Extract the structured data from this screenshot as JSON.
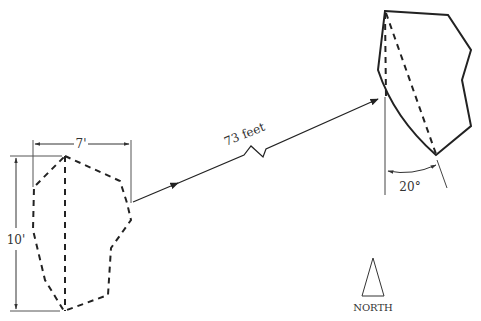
{
  "diagram": {
    "title": "",
    "labels": {
      "width_dimension": "7'",
      "height_dimension": "10'",
      "distance": "73 feet",
      "angle": "20°",
      "north": "NORTH"
    },
    "colors": {
      "stroke": "#222222",
      "thin_stroke": "#444444",
      "text": "#333333",
      "background": "#ffffff"
    },
    "shapes": {
      "original_outline": {
        "style": "dashed",
        "points": [
          [
            65,
            156
          ],
          [
            120,
            181
          ],
          [
            127,
            203
          ],
          [
            131,
            220
          ],
          [
            111,
            248
          ],
          [
            108,
            295
          ],
          [
            64,
            311
          ],
          [
            45,
            280
          ],
          [
            33,
            230
          ],
          [
            34,
            187
          ]
        ]
      },
      "original_axis": {
        "style": "dashed",
        "from": [
          65,
          156
        ],
        "to": [
          65,
          311
        ]
      },
      "moved_outline": {
        "style": "solid",
        "points": [
          [
            385,
            11
          ],
          [
            448,
            15
          ],
          [
            471,
            50
          ],
          [
            462,
            80
          ],
          [
            471,
            126
          ],
          [
            436,
            155
          ]
        ]
      },
      "moved_axis": {
        "style": "dashed",
        "from": [
          385,
          11
        ],
        "to": [
          386,
          97
        ]
      },
      "moved_diagonal": {
        "style": "dashed",
        "from": [
          385,
          11
        ],
        "to": [
          436,
          155
        ]
      }
    }
  }
}
